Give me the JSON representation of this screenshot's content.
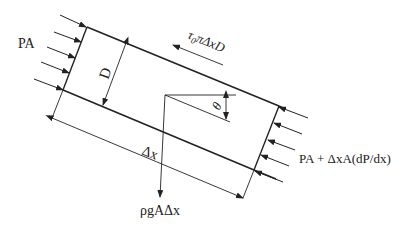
{
  "diagram": {
    "type": "free-body diagram of inclined pipe element",
    "labels": {
      "left_pressure": "PA",
      "right_pressure": "PA + ΔxA(dP/dx)",
      "diameter": "D",
      "shear_force_tau": "τ",
      "shear_force_sub": "0",
      "shear_force_rest": "πΔxD",
      "length": "Δx",
      "weight": "ρgAΔx",
      "angle": "θ"
    },
    "colors": {
      "line": "#222222",
      "background": "#ffffff"
    }
  }
}
